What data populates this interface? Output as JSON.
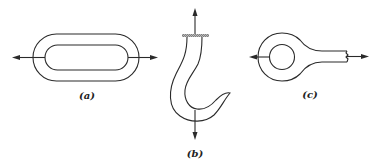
{
  "figure": {
    "panels": [
      {
        "id": "a",
        "label": "(a)",
        "name": "chain-link",
        "description": "Oval chain link loaded in tension along its long axis"
      },
      {
        "id": "b",
        "label": "(b)",
        "name": "crane-hook",
        "description": "Crane hook fixed at top, loaded downward at the bend"
      },
      {
        "id": "c",
        "label": "(c)",
        "name": "eye-bar",
        "description": "Eye bar with pin hole loaded in tension"
      }
    ],
    "colors": {
      "line": "#2a2a2a",
      "background": "#ffffff",
      "hatch": "#888888"
    }
  }
}
